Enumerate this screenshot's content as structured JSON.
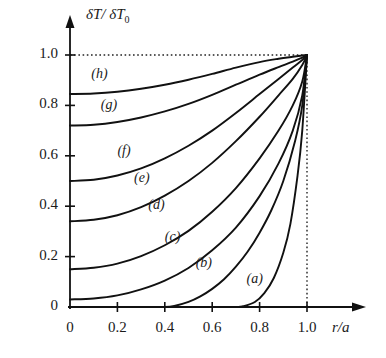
{
  "chart_data": {
    "type": "line",
    "title": "",
    "xlabel": "r/a",
    "ylabel": "δT/δT0",
    "ylabel_main": "δT/ δT",
    "ylabel_sub": "0",
    "xlim": [
      0,
      1.12
    ],
    "ylim": [
      0,
      1.06
    ],
    "xticks": [
      0,
      0.2,
      0.4,
      0.6,
      0.8,
      1.0
    ],
    "xtick_labels": [
      "0",
      "0.2",
      "0.4",
      "0.6",
      "0.8",
      "1.0"
    ],
    "yticks": [
      0,
      0.2,
      0.4,
      0.6,
      0.8,
      1.0
    ],
    "ytick_labels": [
      "0",
      "0.2",
      "0.4",
      "0.6",
      "0.8",
      "1.0"
    ],
    "grid": false,
    "legend": "inline-curve-labels",
    "line_color": "#111111",
    "axis_color": "#111111",
    "guide_color": "#222222",
    "guides": [
      {
        "name": "horizontal-unity-guide",
        "type": "horizontal",
        "value": 1.0,
        "style": "dotted",
        "from": 0,
        "to": 1.0
      },
      {
        "name": "vertical-edge-guide",
        "type": "vertical",
        "value": 1.0,
        "style": "dotted",
        "from": 0,
        "to": 1.0
      }
    ],
    "series": [
      {
        "name": "(a)",
        "label": "(a)",
        "label_x": 0.8,
        "label_y": 0.105,
        "y_intercept": 0.0,
        "x_liftoff": 0.73,
        "x": [
          0.0,
          0.1,
          0.2,
          0.3,
          0.4,
          0.5,
          0.6,
          0.7,
          0.73,
          0.78,
          0.82,
          0.86,
          0.9,
          0.93,
          0.96,
          0.98,
          1.0
        ],
        "values": [
          0.0,
          0.0,
          0.0,
          0.0,
          0.0,
          0.0,
          0.0,
          0.0,
          0.003,
          0.02,
          0.055,
          0.115,
          0.215,
          0.33,
          0.52,
          0.7,
          1.0
        ]
      },
      {
        "name": "(b)",
        "label": "(b)",
        "label_x": 0.585,
        "label_y": 0.165,
        "y_intercept": 0.0,
        "x_liftoff": 0.44,
        "x": [
          0.0,
          0.1,
          0.2,
          0.3,
          0.4,
          0.44,
          0.5,
          0.55,
          0.6,
          0.65,
          0.7,
          0.75,
          0.8,
          0.85,
          0.9,
          0.95,
          0.98,
          1.0
        ],
        "values": [
          0.0,
          0.0,
          0.0,
          0.0,
          0.0,
          0.004,
          0.02,
          0.042,
          0.072,
          0.11,
          0.16,
          0.22,
          0.295,
          0.385,
          0.5,
          0.66,
          0.8,
          1.0
        ]
      },
      {
        "name": "(c)",
        "label": "(c)",
        "label_x": 0.455,
        "label_y": 0.27,
        "y_intercept": 0.03,
        "x_liftoff": 0.0,
        "x": [
          0.0,
          0.1,
          0.2,
          0.3,
          0.4,
          0.5,
          0.6,
          0.7,
          0.8,
          0.88,
          0.94,
          0.98,
          1.0
        ],
        "values": [
          0.03,
          0.034,
          0.046,
          0.07,
          0.105,
          0.155,
          0.225,
          0.315,
          0.44,
          0.57,
          0.7,
          0.84,
          1.0
        ]
      },
      {
        "name": "(d)",
        "label": "(d)",
        "label_x": 0.385,
        "label_y": 0.395,
        "y_intercept": 0.15,
        "x_liftoff": 0.0,
        "x": [
          0.0,
          0.1,
          0.2,
          0.3,
          0.4,
          0.5,
          0.6,
          0.7,
          0.8,
          0.88,
          0.94,
          0.98,
          1.0
        ],
        "values": [
          0.15,
          0.156,
          0.172,
          0.202,
          0.245,
          0.302,
          0.378,
          0.472,
          0.59,
          0.7,
          0.8,
          0.895,
          1.0
        ]
      },
      {
        "name": "(e)",
        "label": "(e)",
        "label_x": 0.325,
        "label_y": 0.505,
        "y_intercept": 0.34,
        "x_liftoff": 0.0,
        "x": [
          0.0,
          0.1,
          0.2,
          0.3,
          0.4,
          0.5,
          0.6,
          0.7,
          0.8,
          0.88,
          0.94,
          0.98,
          1.0
        ],
        "values": [
          0.34,
          0.346,
          0.364,
          0.396,
          0.442,
          0.5,
          0.572,
          0.658,
          0.755,
          0.84,
          0.905,
          0.96,
          1.0
        ]
      },
      {
        "name": "(f)",
        "label": "(f)",
        "label_x": 0.255,
        "label_y": 0.61,
        "y_intercept": 0.5,
        "x_liftoff": 0.0,
        "x": [
          0.0,
          0.1,
          0.2,
          0.3,
          0.4,
          0.5,
          0.6,
          0.7,
          0.8,
          0.88,
          0.94,
          0.98,
          1.0
        ],
        "values": [
          0.5,
          0.505,
          0.522,
          0.55,
          0.59,
          0.64,
          0.7,
          0.77,
          0.845,
          0.905,
          0.95,
          0.98,
          1.0
        ]
      },
      {
        "name": "(g)",
        "label": "(g)",
        "label_x": 0.185,
        "label_y": 0.795,
        "y_intercept": 0.72,
        "x_liftoff": 0.0,
        "x": [
          0.0,
          0.1,
          0.2,
          0.3,
          0.4,
          0.5,
          0.6,
          0.7,
          0.8,
          0.88,
          0.94,
          0.98,
          1.0
        ],
        "values": [
          0.72,
          0.723,
          0.734,
          0.752,
          0.776,
          0.806,
          0.842,
          0.882,
          0.922,
          0.952,
          0.974,
          0.99,
          1.0
        ]
      },
      {
        "name": "(h)",
        "label": "(h)",
        "label_x": 0.145,
        "label_y": 0.915,
        "y_intercept": 0.845,
        "x_liftoff": 0.0,
        "x": [
          0.0,
          0.1,
          0.2,
          0.3,
          0.4,
          0.5,
          0.6,
          0.7,
          0.8,
          0.88,
          0.94,
          0.98,
          1.0
        ],
        "values": [
          0.845,
          0.847,
          0.854,
          0.866,
          0.882,
          0.902,
          0.925,
          0.95,
          0.972,
          0.985,
          0.993,
          0.998,
          1.0
        ]
      }
    ]
  }
}
